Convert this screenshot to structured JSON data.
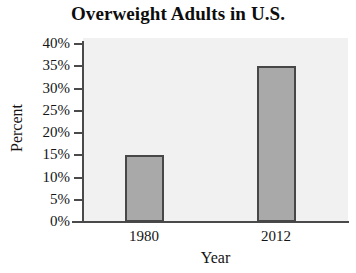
{
  "chart_data": {
    "type": "bar",
    "title": "Overweight Adults in U.S.",
    "xlabel": "Year",
    "ylabel": "Percent",
    "categories": [
      "1980",
      "2012"
    ],
    "values": [
      15,
      35
    ],
    "value_labels": [
      "15%",
      "35%"
    ],
    "ylim": [
      0,
      40
    ],
    "ytick_values": [
      0,
      5,
      10,
      15,
      20,
      25,
      30,
      35,
      40
    ],
    "ytick_labels": [
      "0%",
      "5%",
      "10%",
      "15%",
      "20%",
      "25%",
      "30%",
      "35%",
      "40%"
    ],
    "grid": false,
    "legend": null,
    "series": [
      {
        "name": "Percent of overweight adults",
        "values": [
          15,
          35
        ]
      }
    ],
    "colors": {
      "bar_fill": "#a9a9a9",
      "bar_border": "#474747",
      "plot_background": "#f1f1f1",
      "page_background": "#ffffff",
      "axis_line": "#4a4a4a",
      "text": "#151515"
    }
  }
}
